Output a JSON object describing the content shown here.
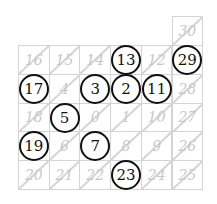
{
  "puzzle": {
    "grid": {
      "origin_x": 18,
      "origin_y": 45,
      "cell_w": 30.7,
      "cell_h": 28.8,
      "line_color": "#d4d4d4",
      "faded_number_color": "#c8c8c8"
    },
    "cells": [
      {
        "row": -1,
        "col": 5,
        "value": "30",
        "circled": false
      },
      {
        "row": 0,
        "col": 0,
        "value": "16",
        "circled": false
      },
      {
        "row": 0,
        "col": 1,
        "value": "15",
        "circled": false
      },
      {
        "row": 0,
        "col": 2,
        "value": "14",
        "circled": false
      },
      {
        "row": 0,
        "col": 3,
        "value": "13",
        "circled": true
      },
      {
        "row": 0,
        "col": 4,
        "value": "12",
        "circled": false
      },
      {
        "row": 0,
        "col": 5,
        "value": "29",
        "circled": true
      },
      {
        "row": 1,
        "col": 0,
        "value": "17",
        "circled": true
      },
      {
        "row": 1,
        "col": 1,
        "value": "4",
        "circled": false
      },
      {
        "row": 1,
        "col": 2,
        "value": "3",
        "circled": true
      },
      {
        "row": 1,
        "col": 3,
        "value": "2",
        "circled": true
      },
      {
        "row": 1,
        "col": 4,
        "value": "11",
        "circled": true
      },
      {
        "row": 1,
        "col": 5,
        "value": "28",
        "circled": false
      },
      {
        "row": 2,
        "col": 0,
        "value": "18",
        "circled": false
      },
      {
        "row": 2,
        "col": 1,
        "value": "5",
        "circled": true
      },
      {
        "row": 2,
        "col": 2,
        "value": "0",
        "circled": false
      },
      {
        "row": 2,
        "col": 3,
        "value": "1",
        "circled": false
      },
      {
        "row": 2,
        "col": 4,
        "value": "10",
        "circled": false
      },
      {
        "row": 2,
        "col": 5,
        "value": "27",
        "circled": false
      },
      {
        "row": 3,
        "col": 0,
        "value": "19",
        "circled": true
      },
      {
        "row": 3,
        "col": 1,
        "value": "6",
        "circled": false
      },
      {
        "row": 3,
        "col": 2,
        "value": "7",
        "circled": true
      },
      {
        "row": 3,
        "col": 3,
        "value": "8",
        "circled": false
      },
      {
        "row": 3,
        "col": 4,
        "value": "9",
        "circled": false
      },
      {
        "row": 3,
        "col": 5,
        "value": "26",
        "circled": false
      },
      {
        "row": 4,
        "col": 0,
        "value": "20",
        "circled": false
      },
      {
        "row": 4,
        "col": 1,
        "value": "21",
        "circled": false
      },
      {
        "row": 4,
        "col": 2,
        "value": "22",
        "circled": false
      },
      {
        "row": 4,
        "col": 3,
        "value": "23",
        "circled": true
      },
      {
        "row": 4,
        "col": 4,
        "value": "24",
        "circled": false
      },
      {
        "row": 4,
        "col": 5,
        "value": "25",
        "circled": false
      }
    ]
  }
}
